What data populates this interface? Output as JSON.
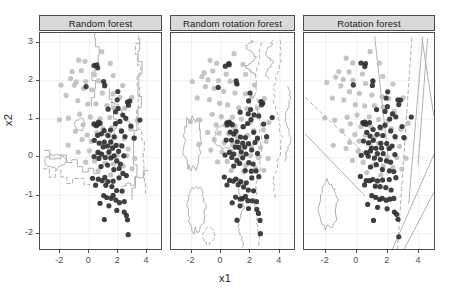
{
  "chart_data": {
    "type": "scatter",
    "title": "",
    "xlabel": "x1",
    "ylabel": "x2",
    "xlim": [
      -3.4,
      5.1
    ],
    "ylim": [
      -2.45,
      3.25
    ],
    "xticks": [
      -2,
      0,
      2,
      4
    ],
    "xtick_labels": [
      "-2",
      "0",
      "2",
      "4"
    ],
    "yticks": [
      -2,
      -1,
      0,
      1,
      2,
      3
    ],
    "ytick_labels": [
      "-2",
      "-1",
      "0",
      "1",
      "2",
      "3"
    ],
    "grid": true,
    "legend": "none",
    "facet_labels": [
      "Random forest",
      "Random rotation forest",
      "Rotation forest"
    ],
    "colors": {
      "class_dark": "#303030",
      "class_light": "#bfbfbf",
      "boundary_line": "#a8a8a8",
      "panel_border": "#4d4d4d",
      "strip_fill": "#d9d9d9",
      "grid": "#f0f0f0",
      "text": "#1a1a1a",
      "tick_text": "#4d4d4d"
    },
    "series": [
      {
        "name": "class-dark",
        "color": "#303030",
        "points": [
          [
            0.3,
            2.42
          ],
          [
            0.55,
            2.38
          ],
          [
            0.52,
            2.43
          ],
          [
            -0.18,
            1.86
          ],
          [
            1.05,
            1.92
          ],
          [
            1.02,
            1.98
          ],
          [
            2.0,
            1.72
          ],
          [
            1.92,
            1.5
          ],
          [
            2.68,
            1.47
          ],
          [
            2.8,
            1.46
          ],
          [
            2.72,
            1.38
          ],
          [
            2.02,
            1.3
          ],
          [
            1.3,
            1.22
          ],
          [
            1.86,
            1.18
          ],
          [
            2.28,
            1.1
          ],
          [
            2.52,
            1.06
          ],
          [
            3.5,
            1.02
          ],
          [
            2.08,
            0.98
          ],
          [
            0.36,
            0.92
          ],
          [
            0.52,
            0.9
          ],
          [
            0.66,
            0.9
          ],
          [
            0.8,
            0.88
          ],
          [
            0.46,
            0.86
          ],
          [
            1.8,
            0.84
          ],
          [
            2.92,
            0.82
          ],
          [
            1.46,
            0.76
          ],
          [
            1.02,
            0.7
          ],
          [
            2.2,
            0.66
          ],
          [
            0.62,
            0.62
          ],
          [
            0.86,
            0.58
          ],
          [
            1.34,
            0.56
          ],
          [
            1.7,
            0.52
          ],
          [
            2.46,
            0.52
          ],
          [
            3.08,
            0.5
          ],
          [
            0.4,
            0.44
          ],
          [
            0.72,
            0.42
          ],
          [
            1.08,
            0.4
          ],
          [
            1.52,
            0.38
          ],
          [
            1.9,
            0.36
          ],
          [
            2.3,
            0.34
          ],
          [
            0.96,
            0.28
          ],
          [
            1.24,
            0.26
          ],
          [
            1.62,
            0.22
          ],
          [
            2.06,
            0.2
          ],
          [
            0.58,
            0.16
          ],
          [
            0.88,
            0.12
          ],
          [
            1.34,
            0.1
          ],
          [
            1.74,
            0.08
          ],
          [
            2.44,
            0.06
          ],
          [
            0.3,
            0.02
          ],
          [
            0.7,
            -0.02
          ],
          [
            1.1,
            -0.04
          ],
          [
            1.5,
            -0.06
          ],
          [
            1.92,
            -0.1
          ],
          [
            2.18,
            -0.14
          ],
          [
            1.28,
            -0.2
          ],
          [
            0.86,
            -0.26
          ],
          [
            1.66,
            -0.3
          ],
          [
            2.06,
            -0.34
          ],
          [
            2.34,
            -0.4
          ],
          [
            0.2,
            -0.52
          ],
          [
            0.62,
            -0.56
          ],
          [
            0.88,
            -0.58
          ],
          [
            1.06,
            -0.56
          ],
          [
            1.32,
            -0.6
          ],
          [
            1.7,
            -0.62
          ],
          [
            2.08,
            -0.58
          ],
          [
            2.54,
            -0.52
          ],
          [
            0.46,
            -0.7
          ],
          [
            1.18,
            -0.76
          ],
          [
            1.52,
            -0.8
          ],
          [
            1.88,
            -0.84
          ],
          [
            2.26,
            -0.88
          ],
          [
            0.98,
            -1.02
          ],
          [
            1.26,
            -1.06
          ],
          [
            1.48,
            -1.08
          ],
          [
            1.66,
            -1.04
          ],
          [
            1.86,
            -1.1
          ],
          [
            2.12,
            -1.14
          ],
          [
            2.4,
            -1.12
          ],
          [
            0.72,
            -1.22
          ],
          [
            1.32,
            -1.28
          ],
          [
            1.92,
            -1.34
          ],
          [
            2.46,
            -1.4
          ],
          [
            2.6,
            -1.48
          ],
          [
            1.04,
            -1.62
          ],
          [
            2.66,
            -1.66
          ],
          [
            2.72,
            -2.04
          ]
        ]
      },
      {
        "name": "class-light",
        "color": "#bfbfbf",
        "points": [
          [
            0.88,
            2.74
          ],
          [
            -0.7,
            2.56
          ],
          [
            -0.3,
            2.5
          ],
          [
            1.46,
            2.46
          ],
          [
            -1.18,
            2.26
          ],
          [
            -0.52,
            2.22
          ],
          [
            0.34,
            2.18
          ],
          [
            1.7,
            2.12
          ],
          [
            -1.32,
            2.06
          ],
          [
            -0.92,
            2.02
          ],
          [
            -0.22,
            1.98
          ],
          [
            0.6,
            1.96
          ],
          [
            1.06,
            1.94
          ],
          [
            2.3,
            1.88
          ],
          [
            -1.02,
            1.84
          ],
          [
            -0.44,
            1.76
          ],
          [
            0.22,
            1.72
          ],
          [
            0.94,
            1.66
          ],
          [
            1.62,
            1.62
          ],
          [
            2.1,
            1.58
          ],
          [
            2.96,
            1.52
          ],
          [
            -0.8,
            1.46
          ],
          [
            -0.12,
            1.42
          ],
          [
            0.48,
            1.38
          ],
          [
            1.18,
            1.34
          ],
          [
            1.74,
            1.3
          ],
          [
            2.42,
            1.24
          ],
          [
            -1.46,
            1.02
          ],
          [
            -0.62,
            1.08
          ],
          [
            0.06,
            1.06
          ],
          [
            0.76,
            1.04
          ],
          [
            1.4,
            1.0
          ],
          [
            2.02,
            0.96
          ],
          [
            3.3,
            0.94
          ],
          [
            -0.38,
            0.88
          ],
          [
            0.28,
            0.84
          ],
          [
            0.94,
            0.8
          ],
          [
            1.56,
            0.78
          ],
          [
            2.22,
            0.74
          ],
          [
            2.86,
            0.7
          ],
          [
            -0.9,
            0.66
          ],
          [
            -0.18,
            0.62
          ],
          [
            0.52,
            0.6
          ],
          [
            1.16,
            0.58
          ],
          [
            1.8,
            0.54
          ],
          [
            2.44,
            0.5
          ],
          [
            3.06,
            0.46
          ],
          [
            -0.46,
            0.42
          ],
          [
            0.18,
            0.38
          ],
          [
            0.82,
            0.36
          ],
          [
            1.44,
            0.32
          ],
          [
            2.06,
            0.28
          ],
          [
            2.7,
            0.24
          ],
          [
            -0.72,
            0.18
          ],
          [
            0.06,
            0.14
          ],
          [
            0.7,
            0.12
          ],
          [
            1.32,
            0.08
          ],
          [
            1.96,
            0.04
          ],
          [
            2.58,
            0.0
          ],
          [
            3.18,
            -0.04
          ],
          [
            -0.24,
            -0.1
          ],
          [
            0.42,
            -0.14
          ],
          [
            1.06,
            -0.18
          ],
          [
            1.68,
            -0.22
          ],
          [
            2.32,
            -0.26
          ],
          [
            2.94,
            -0.3
          ],
          [
            -1.5,
            0.3
          ],
          [
            -1.62,
            1.58
          ],
          [
            -1.9,
            1.94
          ],
          [
            -2.06,
            0.98
          ],
          [
            0.66,
            -0.36
          ],
          [
            1.52,
            -0.42
          ]
        ]
      }
    ],
    "boundaries": {
      "panel1_description": "axis-parallel staircase contours, solid and dashed",
      "panel2_description": "wiggly near-vertical contours with dashed segments",
      "panel3_description": "oblique straight-line contours, solid and dashed"
    }
  },
  "panels": [
    {
      "id": "panel-random-forest",
      "label": "Random forest"
    },
    {
      "id": "panel-random-rotation-forest",
      "label": "Random rotation forest"
    },
    {
      "id": "panel-rotation-forest",
      "label": "Rotation forest"
    }
  ]
}
